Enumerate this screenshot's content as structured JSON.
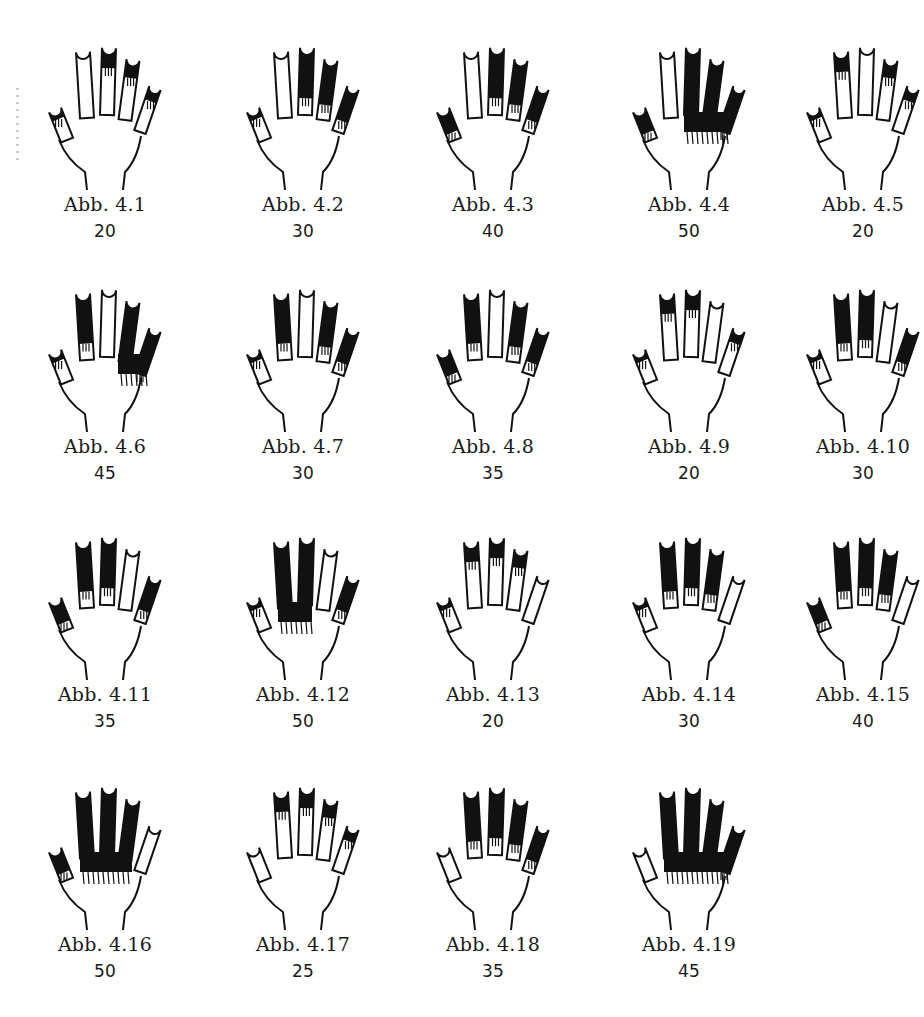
{
  "page": {
    "language": "de",
    "ink_color": "#111111",
    "paper_color": "#ffffff"
  },
  "figures": [
    {
      "label": "Abb. 4.1",
      "value": "20",
      "fill": [
        1,
        0,
        1,
        1,
        1
      ]
    },
    {
      "label": "Abb. 4.2",
      "value": "30",
      "fill": [
        1,
        0,
        2,
        2,
        2
      ]
    },
    {
      "label": "Abb. 4.3",
      "value": "40",
      "fill": [
        2,
        0,
        2,
        2,
        2
      ]
    },
    {
      "label": "Abb. 4.4",
      "value": "50",
      "fill": [
        2,
        0,
        3,
        3,
        3
      ]
    },
    {
      "label": "Abb. 4.5",
      "value": "20",
      "fill": [
        1,
        1,
        0,
        1,
        1
      ]
    },
    {
      "label": "Abb. 4.6",
      "value": "45",
      "fill": [
        1,
        2,
        0,
        3,
        3
      ]
    },
    {
      "label": "Abb. 4.7",
      "value": "30",
      "fill": [
        1,
        2,
        0,
        2,
        2
      ]
    },
    {
      "label": "Abb. 4.8",
      "value": "35",
      "fill": [
        2,
        2,
        0,
        2,
        2
      ]
    },
    {
      "label": "Abb. 4.9",
      "value": "20",
      "fill": [
        1,
        1,
        1,
        0,
        1
      ]
    },
    {
      "label": "Abb. 4.10",
      "value": "30",
      "fill": [
        1,
        2,
        2,
        0,
        2
      ]
    },
    {
      "label": "Abb. 4.11",
      "value": "35",
      "fill": [
        2,
        2,
        2,
        0,
        2
      ]
    },
    {
      "label": "Abb. 4.12",
      "value": "50",
      "fill": [
        1,
        3,
        3,
        0,
        2
      ]
    },
    {
      "label": "Abb. 4.13",
      "value": "20",
      "fill": [
        1,
        1,
        1,
        1,
        0
      ]
    },
    {
      "label": "Abb. 4.14",
      "value": "30",
      "fill": [
        1,
        2,
        2,
        2,
        0
      ]
    },
    {
      "label": "Abb. 4.15",
      "value": "40",
      "fill": [
        2,
        2,
        2,
        2,
        0
      ]
    },
    {
      "label": "Abb. 4.16",
      "value": "50",
      "fill": [
        2,
        3,
        3,
        3,
        0
      ]
    },
    {
      "label": "Abb. 4.17",
      "value": "25",
      "fill": [
        0,
        1,
        1,
        1,
        1
      ]
    },
    {
      "label": "Abb. 4.18",
      "value": "35",
      "fill": [
        0,
        2,
        2,
        2,
        2
      ]
    },
    {
      "label": "Abb. 4.19",
      "value": "45",
      "fill": [
        0,
        3,
        3,
        3,
        3
      ]
    }
  ],
  "legend": {
    "fill_levels": {
      "0": "none",
      "1": "fingertip",
      "2": "finger",
      "3": "finger-into-palm"
    },
    "finger_order": [
      "thumb",
      "index",
      "middle",
      "ring",
      "pinky"
    ]
  }
}
